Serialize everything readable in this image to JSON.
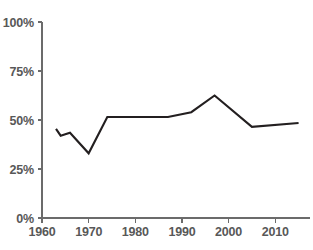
{
  "chart_data": {
    "type": "line",
    "title": "",
    "subtitle": "",
    "xlabel": "",
    "ylabel": "",
    "xlim": [
      1960,
      2016
    ],
    "ylim": [
      0,
      100
    ],
    "grid": false,
    "legend": "none",
    "y_tick_labels": [
      "0%",
      "25%",
      "50%",
      "75%",
      "100%"
    ],
    "y_ticks": [
      0,
      25,
      50,
      75,
      100
    ],
    "x_tick_labels": [
      "1960",
      "1970",
      "1980",
      "1990",
      "2000",
      "2010"
    ],
    "x_ticks": [
      1960,
      1970,
      1980,
      1990,
      2000,
      2010
    ],
    "series": [
      {
        "name": "series-1",
        "color": "#231f20",
        "x": [
          1963,
          1964,
          1966,
          1970,
          1974,
          1987,
          1992,
          1997,
          2005,
          2015
        ],
        "values": [
          45.5,
          42.0,
          43.5,
          33.0,
          51.5,
          51.5,
          54.0,
          62.5,
          46.5,
          48.5
        ]
      }
    ]
  },
  "axis_colors": {
    "axis": "#6b6b6b",
    "tick_text": "#585858",
    "line": "#231f20",
    "background": "#ffffff"
  }
}
